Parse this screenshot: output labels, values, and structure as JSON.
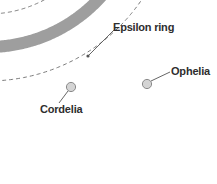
{
  "diagram": {
    "background_color": "#ffffff",
    "ring_band": {
      "name": "Epsilon ring",
      "color": "#9e9e9e",
      "stroke_width": 12,
      "radius": 152,
      "center_x": -12,
      "center_y": -105,
      "start_angle_deg": 52,
      "end_angle_deg": 108
    },
    "orbits": [
      {
        "name": "cordelia-orbit",
        "style": "dashed",
        "color": "#7a7a7a",
        "radius": 186,
        "dash": "4 3"
      },
      {
        "name": "ophelia-orbit",
        "style": "dashed",
        "color": "#7a7a7a",
        "radius": 119,
        "dash": "4 3"
      }
    ],
    "moons": [
      {
        "name": "Cordelia",
        "label": "Cordelia",
        "cx": 71,
        "cy": 87,
        "r": 4.6,
        "fill": "#d4d4d4",
        "stroke": "#8a8a8a",
        "leader": {
          "x1": 68,
          "y1": 91,
          "x2": 59,
          "y2": 103
        }
      },
      {
        "name": "Ophelia",
        "label": "Ophelia",
        "cx": 147,
        "cy": 84,
        "r": 4.6,
        "fill": "#d4d4d4",
        "stroke": "#8a8a8a",
        "leader": {
          "x1": 151,
          "y1": 81,
          "x2": 170,
          "y2": 72
        }
      }
    ],
    "annotations": [
      {
        "name": "epsilon-ring-callout",
        "label": "Epsilon ring",
        "leader": {
          "x1": 115,
          "y1": 29,
          "x2": 89,
          "y2": 55
        },
        "dot": {
          "cx": 88,
          "cy": 56,
          "r": 1.6,
          "fill": "#555555"
        }
      }
    ],
    "labels": {
      "epsilon_ring": "Epsilon ring",
      "ophelia": "Ophelia",
      "cordelia": "Cordelia"
    },
    "colors": {
      "ring_gray": "#9e9e9e",
      "orbit_gray": "#7a7a7a",
      "text": "#2e2e2e",
      "moon_fill": "#d4d4d4",
      "moon_stroke": "#8a8a8a",
      "leader_line": "#555555"
    }
  }
}
